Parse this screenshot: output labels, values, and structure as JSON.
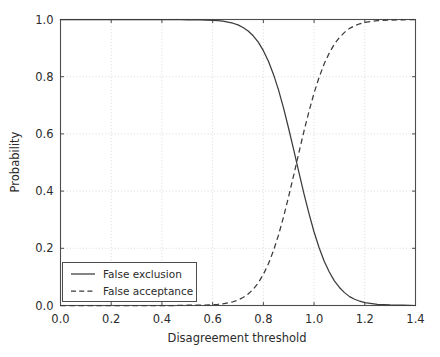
{
  "chart_data": {
    "type": "line",
    "title": "",
    "subtitle": "",
    "xlabel": "Disagreement threshold",
    "ylabel": "Probability",
    "xlim": [
      0.0,
      1.4
    ],
    "ylim": [
      0.0,
      1.0
    ],
    "grid": true,
    "grid_style": "dotted",
    "legend_position": "lower left",
    "xticks": [
      "0.0",
      "0.2",
      "0.4",
      "0.6",
      "0.8",
      "1.0",
      "1.2",
      "1.4"
    ],
    "xtick_values": [
      0.0,
      0.2,
      0.4,
      0.6,
      0.8,
      1.0,
      1.2,
      1.4
    ],
    "yticks": [
      "0.0",
      "0.2",
      "0.4",
      "0.6",
      "0.8",
      "1.0"
    ],
    "ytick_values": [
      0.0,
      0.2,
      0.4,
      0.6,
      0.8,
      1.0
    ],
    "x": [
      0.0,
      0.05,
      0.1,
      0.15,
      0.2,
      0.25,
      0.3,
      0.35,
      0.4,
      0.45,
      0.5,
      0.55,
      0.6,
      0.62,
      0.64,
      0.66,
      0.68,
      0.7,
      0.72,
      0.74,
      0.76,
      0.78,
      0.8,
      0.82,
      0.84,
      0.86,
      0.88,
      0.9,
      0.92,
      0.94,
      0.96,
      0.98,
      1.0,
      1.02,
      1.04,
      1.06,
      1.08,
      1.1,
      1.12,
      1.14,
      1.16,
      1.18,
      1.2,
      1.25,
      1.3,
      1.35,
      1.4
    ],
    "series": [
      {
        "name": "False exclusion",
        "style": "solid",
        "color": "#3b3b3b",
        "values": [
          1.0,
          1.0,
          1.0,
          1.0,
          1.0,
          1.0,
          1.0,
          1.0,
          1.0,
          1.0,
          0.999,
          0.999,
          0.997,
          0.996,
          0.994,
          0.991,
          0.987,
          0.981,
          0.972,
          0.96,
          0.943,
          0.921,
          0.891,
          0.854,
          0.808,
          0.753,
          0.689,
          0.618,
          0.543,
          0.466,
          0.391,
          0.321,
          0.257,
          0.202,
          0.155,
          0.117,
          0.086,
          0.063,
          0.045,
          0.031,
          0.022,
          0.015,
          0.01,
          0.004,
          0.002,
          0.001,
          0.0
        ]
      },
      {
        "name": "False acceptance",
        "style": "dashed",
        "color": "#3b3b3b",
        "values": [
          0.0,
          0.0,
          0.0,
          0.0,
          0.0,
          0.0,
          0.0,
          0.0,
          0.0,
          0.0,
          0.001,
          0.001,
          0.003,
          0.004,
          0.006,
          0.009,
          0.013,
          0.019,
          0.028,
          0.04,
          0.057,
          0.079,
          0.109,
          0.146,
          0.192,
          0.247,
          0.311,
          0.382,
          0.457,
          0.534,
          0.609,
          0.679,
          0.743,
          0.798,
          0.845,
          0.883,
          0.914,
          0.937,
          0.955,
          0.969,
          0.978,
          0.985,
          0.99,
          0.996,
          0.998,
          0.999,
          1.0
        ]
      }
    ],
    "legend": [
      {
        "label": "False exclusion",
        "style": "solid"
      },
      {
        "label": "False acceptance",
        "style": "dashed"
      }
    ],
    "annotations": [
      {
        "text": "curves cross at approximately x = 0.91, y = 0.50"
      }
    ]
  }
}
